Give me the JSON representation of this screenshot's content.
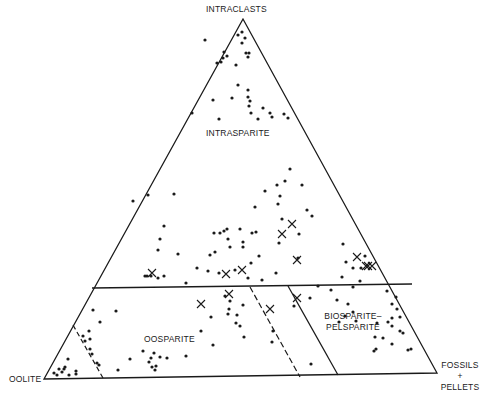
{
  "vertices": {
    "top": "INTRACLASTS",
    "bottom_left": "OOLITE",
    "bottom_right_line1": "FOSSILS",
    "bottom_right_line2": "+",
    "bottom_right_line3": "PELLETS"
  },
  "fields": {
    "upper": "INTRASPARITE",
    "lower_left": "OOSPARITE",
    "lower_right_line1": "BIOSPARITE–",
    "lower_right_line2": "PELSPARITE"
  },
  "colors": {
    "ink": "#1a1a1a",
    "background": "#ffffff"
  },
  "dots": [
    [
      238,
      35
    ],
    [
      242,
      32
    ],
    [
      245,
      38
    ],
    [
      242,
      43
    ],
    [
      205,
      40
    ],
    [
      223,
      58
    ],
    [
      246,
      53
    ],
    [
      249,
      53
    ],
    [
      248,
      57
    ],
    [
      224,
      52
    ],
    [
      221,
      62
    ],
    [
      227,
      56
    ],
    [
      217,
      63
    ],
    [
      236,
      65
    ],
    [
      213,
      100
    ],
    [
      232,
      98
    ],
    [
      248,
      97
    ],
    [
      250,
      101
    ],
    [
      238,
      85
    ],
    [
      251,
      113
    ],
    [
      192,
      113
    ],
    [
      270,
      113
    ],
    [
      284,
      114
    ],
    [
      288,
      118
    ],
    [
      248,
      90
    ],
    [
      249,
      106
    ],
    [
      272,
      117
    ],
    [
      263,
      108
    ],
    [
      258,
      119
    ],
    [
      219,
      119
    ],
    [
      285,
      181
    ],
    [
      290,
      169
    ],
    [
      302,
      185
    ],
    [
      277,
      185
    ],
    [
      255,
      207
    ],
    [
      278,
      204
    ],
    [
      282,
      219
    ],
    [
      280,
      196
    ],
    [
      307,
      210
    ],
    [
      312,
      216
    ],
    [
      299,
      234
    ],
    [
      343,
      244
    ],
    [
      174,
      194
    ],
    [
      148,
      195
    ],
    [
      133,
      201
    ],
    [
      164,
      226
    ],
    [
      214,
      233
    ],
    [
      215,
      252
    ],
    [
      251,
      263
    ],
    [
      276,
      273
    ],
    [
      298,
      258
    ],
    [
      279,
      243
    ],
    [
      158,
      250
    ],
    [
      160,
      239
    ],
    [
      256,
      232
    ],
    [
      178,
      254
    ],
    [
      219,
      273
    ],
    [
      262,
      280
    ],
    [
      342,
      277
    ],
    [
      346,
      262
    ],
    [
      353,
      268
    ],
    [
      353,
      287
    ],
    [
      318,
      286
    ],
    [
      331,
      290
    ],
    [
      208,
      271
    ],
    [
      235,
      270
    ],
    [
      248,
      278
    ],
    [
      164,
      276
    ],
    [
      147,
      276
    ],
    [
      197,
      268
    ],
    [
      151,
      276
    ],
    [
      243,
      247
    ],
    [
      224,
      231
    ],
    [
      186,
      283
    ],
    [
      158,
      278
    ],
    [
      145,
      276
    ],
    [
      240,
      229
    ],
    [
      243,
      242
    ],
    [
      227,
      229
    ],
    [
      259,
      256
    ],
    [
      220,
      233
    ],
    [
      265,
      191
    ],
    [
      230,
      247
    ],
    [
      210,
      255
    ],
    [
      252,
      233
    ],
    [
      228,
      239
    ],
    [
      360,
      281
    ],
    [
      365,
      256
    ],
    [
      361,
      268
    ],
    [
      337,
      300
    ],
    [
      377,
      323
    ],
    [
      387,
      291
    ],
    [
      396,
      297
    ],
    [
      392,
      304
    ],
    [
      397,
      309
    ],
    [
      400,
      317
    ],
    [
      392,
      318
    ],
    [
      400,
      331
    ],
    [
      403,
      333
    ],
    [
      383,
      338
    ],
    [
      375,
      337
    ],
    [
      392,
      344
    ],
    [
      408,
      350
    ],
    [
      411,
      349
    ],
    [
      376,
      349
    ],
    [
      374,
      351
    ],
    [
      345,
      316
    ],
    [
      356,
      321
    ],
    [
      353,
      312
    ],
    [
      348,
      304
    ],
    [
      339,
      322
    ],
    [
      388,
      322
    ],
    [
      392,
      326
    ],
    [
      93,
      310
    ],
    [
      116,
      311
    ],
    [
      100,
      322
    ],
    [
      89,
      331
    ],
    [
      90,
      339
    ],
    [
      83,
      336
    ],
    [
      85,
      341
    ],
    [
      92,
      354
    ],
    [
      90,
      349
    ],
    [
      97,
      363
    ],
    [
      99,
      365
    ],
    [
      118,
      370
    ],
    [
      68,
      359
    ],
    [
      65,
      367
    ],
    [
      54,
      373
    ],
    [
      59,
      369
    ],
    [
      69,
      375
    ],
    [
      76,
      374
    ],
    [
      57,
      375
    ],
    [
      62,
      372
    ],
    [
      76,
      371
    ],
    [
      64,
      369
    ],
    [
      151,
      358
    ],
    [
      154,
      353
    ],
    [
      149,
      362
    ],
    [
      160,
      357
    ],
    [
      167,
      358
    ],
    [
      186,
      356
    ],
    [
      152,
      367
    ],
    [
      155,
      370
    ],
    [
      156,
      366
    ],
    [
      130,
      359
    ],
    [
      143,
      351
    ],
    [
      229,
      309
    ],
    [
      228,
      314
    ],
    [
      211,
      317
    ],
    [
      201,
      331
    ],
    [
      237,
      315
    ],
    [
      213,
      345
    ],
    [
      244,
      337
    ],
    [
      240,
      326
    ],
    [
      236,
      323
    ],
    [
      273,
      331
    ],
    [
      272,
      342
    ],
    [
      243,
      305
    ],
    [
      225,
      296
    ],
    [
      230,
      301
    ],
    [
      310,
      298
    ],
    [
      294,
      306
    ],
    [
      311,
      364
    ]
  ],
  "crosses": [
    [
      152,
      273
    ],
    [
      292,
      224
    ],
    [
      282,
      234
    ],
    [
      297,
      260
    ],
    [
      226,
      274
    ],
    [
      242,
      270
    ],
    [
      357,
      257
    ],
    [
      368,
      266
    ],
    [
      366,
      266
    ],
    [
      372,
      266
    ],
    [
      201,
      304
    ],
    [
      229,
      294
    ],
    [
      270,
      309
    ],
    [
      297,
      298
    ]
  ],
  "chart_data": {
    "type": "ternary-scatter",
    "title": "",
    "vertex_labels": [
      "INTRACLASTS",
      "OOLITE",
      "FOSSILS + PELLETS"
    ],
    "field_labels": [
      "INTRASPARITE",
      "OOSPARITE",
      "BIOSPARITE–PELSPARITE"
    ],
    "boundaries": [
      {
        "type": "solid",
        "description": "horizontal line at ~25% intraclasts separating intrasparite from lower fields"
      },
      {
        "type": "dashed",
        "description": "short dashed line near oolite vertex, inner oolite field"
      },
      {
        "type": "dashed",
        "description": "dashed line dividing oosparite region at ~ fossils/oolite ratio 1:1"
      },
      {
        "type": "solid",
        "description": "solid line separating oosparite from biosparite-pelsparite"
      }
    ],
    "markers": [
      "dot",
      "x"
    ],
    "grid": false,
    "legend": null
  }
}
